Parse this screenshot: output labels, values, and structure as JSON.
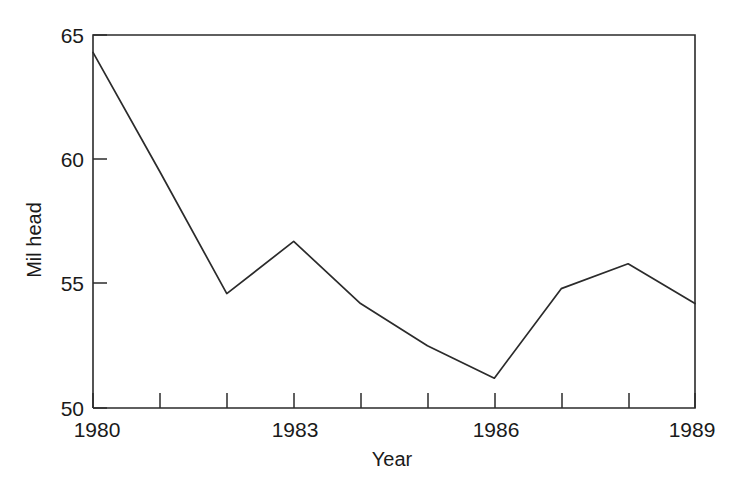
{
  "chart_data": {
    "type": "line",
    "title": "",
    "xlabel": "Year",
    "ylabel": "Mil head",
    "x": [
      1980,
      1981,
      1982,
      1983,
      1984,
      1985,
      1986,
      1987,
      1988,
      1989
    ],
    "values": [
      64.3,
      59.5,
      54.6,
      56.7,
      54.2,
      52.5,
      51.2,
      54.8,
      55.8,
      54.2
    ],
    "series": [
      {
        "name": "Mil head",
        "values": [
          64.3,
          59.5,
          54.6,
          56.7,
          54.2,
          52.5,
          51.2,
          54.8,
          55.8,
          54.2
        ]
      }
    ],
    "xlim": [
      1980,
      1989
    ],
    "ylim": [
      50,
      65
    ],
    "x_tick_values": [
      1980,
      1981,
      1982,
      1983,
      1984,
      1985,
      1986,
      1987,
      1988,
      1989
    ],
    "x_tick_labels": [
      "1980",
      "",
      "",
      "1983",
      "",
      "",
      "1986",
      "",
      "",
      "1989"
    ],
    "y_tick_values": [
      50,
      55,
      60,
      65
    ],
    "y_tick_labels": [
      "50",
      "55",
      "60",
      "65"
    ],
    "grid": false,
    "legend": false,
    "legend_position": "none",
    "line_color": "#2b2b2b",
    "axis_color": "#2b2b2b",
    "background_color": "#ffffff"
  },
  "labels": {
    "y_axis_title": "Mil head",
    "x_axis_title": "Year",
    "y_65": "65",
    "y_60": "60",
    "y_55": "55",
    "y_50": "50",
    "x_1980": "1980",
    "x_1983": "1983",
    "x_1986": "1986",
    "x_1989": "1989"
  }
}
